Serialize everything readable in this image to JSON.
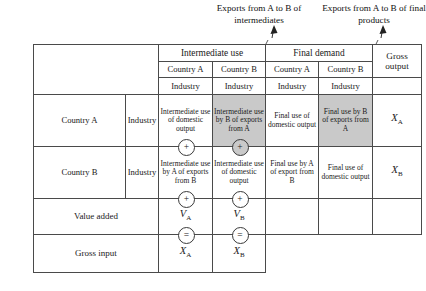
{
  "annotations": {
    "intermediates": "Exports from A to B of intermediates",
    "final_products": "Exports from A to B of final products"
  },
  "table": {
    "header": {
      "corner": "",
      "groups": [
        {
          "label": "Intermediate use",
          "colspan": 2
        },
        {
          "label": "Final demand",
          "colspan": 2
        }
      ],
      "gross_output": "Gross output",
      "countries": [
        "Country A",
        "Country B",
        "Country A",
        "Country B"
      ],
      "sectors": [
        "Industry",
        "Industry",
        "Industry",
        "Industry"
      ]
    },
    "rows": [
      {
        "country": "Country A",
        "industry": "Industry",
        "cells": [
          "Intermediate use of domestic output",
          "Intermediate use by B of exports from A",
          "Final use of domestic output",
          "Final use by B of exports from A"
        ],
        "output_var": "X",
        "output_sub": "A"
      },
      {
        "country": "Country B",
        "industry": "Industry",
        "cells": [
          "Intermediate use by A of exports from B",
          "Intermediate use of domestic output",
          "Final use by A of export from B",
          "Final use of domestic output"
        ],
        "output_var": "X",
        "output_sub": "B"
      }
    ],
    "value_added": {
      "label": "Value added",
      "operator": "+",
      "a_var": "V",
      "a_sub": "A",
      "b_var": "V",
      "b_sub": "B"
    },
    "gross_input": {
      "label": "Gross input",
      "operator": "=",
      "a_var": "X",
      "a_sub": "A",
      "b_var": "X",
      "b_sub": "B"
    },
    "row_operator": "+"
  }
}
